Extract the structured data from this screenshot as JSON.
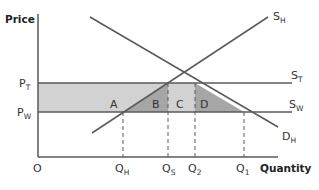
{
  "diagram": {
    "type": "supply-demand-tariff",
    "axes": {
      "y_label": "Price",
      "x_label": "Quantity",
      "origin_label": "O"
    },
    "price_levels": [
      {
        "id": "PT",
        "main": "P",
        "sub": "T"
      },
      {
        "id": "PW",
        "main": "P",
        "sub": "W"
      }
    ],
    "quantities": [
      {
        "id": "QH",
        "main": "Q",
        "sub": "H"
      },
      {
        "id": "QS",
        "main": "Q",
        "sub": "S"
      },
      {
        "id": "Q2",
        "main": "Q",
        "sub": "2"
      },
      {
        "id": "Q1",
        "main": "Q",
        "sub": "1"
      }
    ],
    "curves": [
      {
        "id": "SH",
        "main": "S",
        "sub": "H"
      },
      {
        "id": "ST",
        "main": "S",
        "sub": "T"
      },
      {
        "id": "SW",
        "main": "S",
        "sub": "W"
      },
      {
        "id": "DH",
        "main": "D",
        "sub": "H"
      }
    ],
    "areas": [
      {
        "id": "A",
        "label": "A"
      },
      {
        "id": "B",
        "label": "B"
      },
      {
        "id": "C",
        "label": "C"
      },
      {
        "id": "D",
        "label": "D"
      }
    ],
    "colors": {
      "line": "#5a5a5a",
      "light_fill": "#d2d2d2",
      "dark_fill": "#a6a6a6",
      "text": "#333333"
    }
  }
}
